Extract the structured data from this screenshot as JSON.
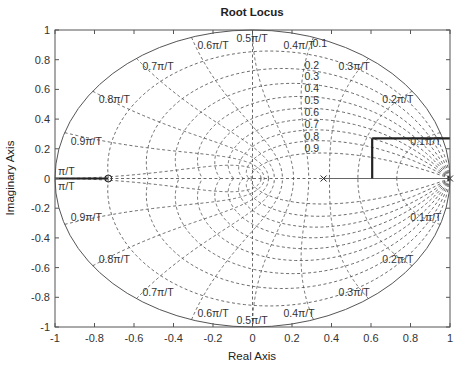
{
  "chart_data": {
    "type": "root-locus",
    "title": "Root Locus",
    "xlabel": "Real Axis",
    "ylabel": "Imaginary Axis",
    "xlim": [
      -1,
      1
    ],
    "ylim": [
      -1,
      1
    ],
    "xticks": [
      -1,
      -0.8,
      -0.6,
      -0.4,
      -0.2,
      0,
      0.2,
      0.4,
      0.6,
      0.8,
      1
    ],
    "yticks": [
      -1,
      -0.8,
      -0.6,
      -0.4,
      -0.2,
      0,
      0.2,
      0.4,
      0.6,
      0.8,
      1
    ],
    "xtick_labels": [
      "-1",
      "-0.8",
      "-0.6",
      "-0.4",
      "-0.2",
      "0",
      "0.2",
      "0.4",
      "0.6",
      "0.8",
      "1"
    ],
    "ytick_labels": [
      "-1",
      "-0.8",
      "-0.6",
      "-0.4",
      "-0.2",
      "0",
      "0.2",
      "0.4",
      "0.6",
      "0.8",
      "1"
    ],
    "grid": "zgrid",
    "damping_ratios": [
      0.1,
      0.2,
      0.3,
      0.4,
      0.5,
      0.6,
      0.7,
      0.8,
      0.9
    ],
    "damping_labels": [
      "0.1",
      "0.2",
      "0.3",
      "0.4",
      "0.5",
      "0.6",
      "0.7",
      "0.8",
      "0.9"
    ],
    "natural_frequencies": [
      0.1,
      0.2,
      0.3,
      0.4,
      0.5,
      0.6,
      0.7,
      0.8,
      0.9,
      1.0
    ],
    "frequency_labels": [
      "0.1π/T",
      "0.2π/T",
      "0.3π/T",
      "0.4π/T",
      "0.5π/T",
      "0.6π/T",
      "0.7π/T",
      "0.8π/T",
      "0.9π/T",
      "π/T"
    ],
    "poles": [
      {
        "re": 0.36,
        "im": 0
      },
      {
        "re": 1.0,
        "im": 0
      }
    ],
    "zeros": [
      {
        "re": -0.73,
        "im": 0
      }
    ],
    "locus_segments": [
      {
        "name": "real-axis-left",
        "points": [
          [
            -1,
            0
          ],
          [
            -0.73,
            0
          ]
        ]
      },
      {
        "name": "real-axis-right",
        "points": [
          [
            0.36,
            0
          ],
          [
            1,
            0
          ]
        ]
      },
      {
        "name": "vertical-branch",
        "points": [
          [
            0.606,
            0
          ],
          [
            0.606,
            0.27
          ]
        ]
      },
      {
        "name": "horizontal-branch",
        "points": [
          [
            0.606,
            0.27
          ],
          [
            1,
            0.27
          ]
        ]
      }
    ],
    "unit_circle": true
  }
}
